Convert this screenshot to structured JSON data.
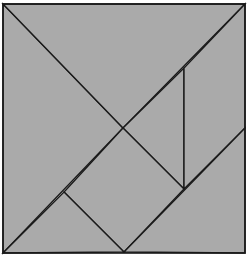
{
  "diagram": {
    "type": "tangram",
    "canvas": {
      "width": 250,
      "height": 267
    },
    "colors": {
      "fill": "#aaaaaa",
      "stroke": "#1a1a1a",
      "background": "#ffffff"
    },
    "square": {
      "x1": 3,
      "y1": 4,
      "x2": 245,
      "y2": 253
    },
    "pieces": [
      {
        "name": "large-triangle-left",
        "points": "3,4 123,128 3,253"
      },
      {
        "name": "large-triangle-top",
        "points": "3,4 245,4 123,128"
      },
      {
        "name": "small-triangle-right",
        "points": "184,68 184,189 123,128"
      },
      {
        "name": "parallelogram-right",
        "points": "245,4 245,128 184,189 184,68"
      },
      {
        "name": "square-middle",
        "points": "123,128 184,189 124,252 64,192"
      },
      {
        "name": "small-triangle-bottom",
        "points": "3,253 64,192 124,252"
      },
      {
        "name": "medium-triangle-bottom-right",
        "points": "245,128 245,253 124,252"
      }
    ]
  }
}
